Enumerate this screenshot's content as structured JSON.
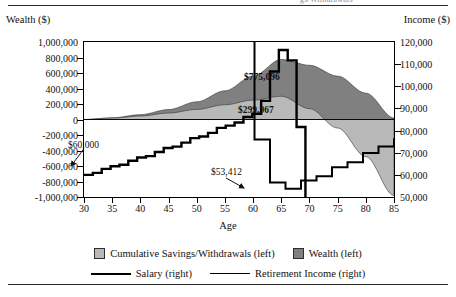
{
  "caption_tail": "gs/Withdrawals",
  "axes": {
    "left_title": "Wealth ($)",
    "right_title": "Income ($)",
    "x_title": "Age",
    "left_ticks": [
      "1,000,000",
      "800,000",
      "600,000",
      "400,000",
      "200,000",
      "0",
      "-200,000",
      "-400,000",
      "-600,000",
      "-800,000",
      "-1,000,000"
    ],
    "right_ticks": [
      "120,000",
      "110,000",
      "100,000",
      "90,000",
      "80,000",
      "70,000",
      "60,000",
      "50,000"
    ],
    "x_ticks": [
      "30",
      "35",
      "40",
      "45",
      "50",
      "55",
      "60",
      "65",
      "70",
      "75",
      "80",
      "85"
    ]
  },
  "annotations": {
    "wealth_peak": "$775,096",
    "savings_peak": "$299,967",
    "start_salary": "$60,000",
    "retirement_income": "$53,412"
  },
  "legend": {
    "savings": "Cumulative Savings/Withdrawals (left)",
    "wealth": "Wealth (left)",
    "salary": "Salary (right)",
    "retirement": "Retirement Income (right)"
  },
  "colors": {
    "savings_fill": "#b9b9b9",
    "wealth_fill": "#808080",
    "line": "#000000",
    "frame": "#000000"
  },
  "chart_data": {
    "type": "area",
    "title": "",
    "xlabel": "Age",
    "ylabel": "Wealth ($)",
    "y2label": "Income ($)",
    "xlim": [
      30,
      85
    ],
    "ylim": [
      -1000000,
      1000000
    ],
    "y2lim": [
      50000,
      120000
    ],
    "grid": false,
    "legend_position": "bottom",
    "x": [
      30,
      35,
      40,
      45,
      50,
      55,
      60,
      65,
      70,
      75,
      80,
      85
    ],
    "series": [
      {
        "name": "Cumulative Savings/Withdrawals (left)",
        "axis": "left",
        "type": "area",
        "fill": "#b9b9b9",
        "values": [
          0,
          18000,
          45000,
          83000,
          130000,
          190000,
          250000,
          299967,
          140000,
          -110000,
          -480000,
          -980000
        ]
      },
      {
        "name": "Wealth (left)",
        "axis": "left",
        "type": "area",
        "fill": "#808080",
        "values": [
          0,
          22000,
          62000,
          128000,
          228000,
          370000,
          560000,
          775096,
          700000,
          560000,
          340000,
          20000
        ]
      },
      {
        "name": "Salary (right)",
        "axis": "right",
        "type": "step-line",
        "values": [
          60000,
          63900,
          68000,
          72500,
          77200,
          82200,
          87600,
          117000,
          null,
          null,
          null,
          null
        ]
      },
      {
        "name": "Retirement Income (right)",
        "axis": "right",
        "type": "step-line",
        "values": [
          null,
          null,
          null,
          null,
          null,
          null,
          null,
          53412,
          58500,
          64000,
          70000,
          76500
        ]
      }
    ]
  }
}
